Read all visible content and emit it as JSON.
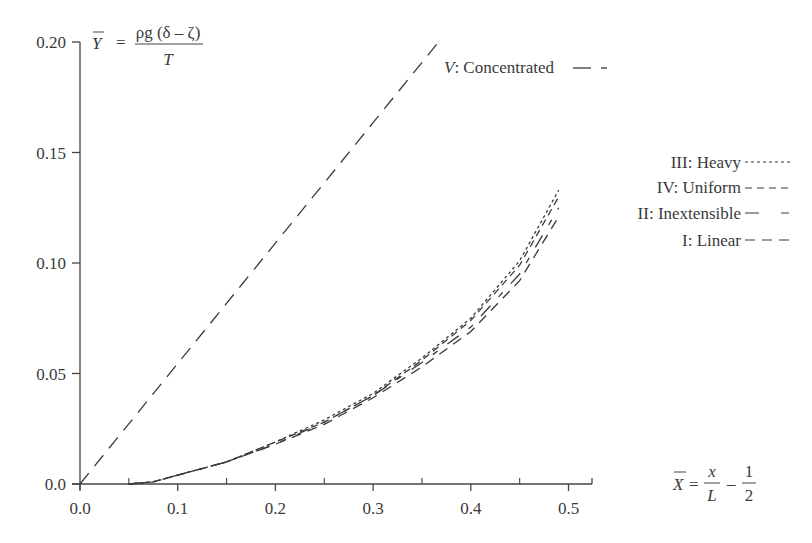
{
  "chart_data": {
    "type": "line",
    "title": "",
    "xlabel": "X̄ = x/L − 1/2",
    "ylabel": "Ȳ = ρg(δ − ζ)/T",
    "xlim": [
      0.0,
      0.524
    ],
    "ylim": [
      0.0,
      0.2
    ],
    "grid": false,
    "legend_position": "right",
    "x_ticks": [
      "0.0",
      "0.1",
      "0.2",
      "0.3",
      "0.4",
      "0.5"
    ],
    "x_minor_ticks": [
      0.05,
      0.15,
      0.25,
      0.35,
      0.45
    ],
    "y_ticks": [
      "0.0",
      "0.05",
      "0.10",
      "0.15",
      "0.20"
    ],
    "series": [
      {
        "name": "V: Concentrated",
        "dash": "long-dash-short-dash",
        "x": [
          0.0,
          0.1,
          0.2,
          0.3,
          0.367
        ],
        "y": [
          0.0,
          0.0545,
          0.109,
          0.1635,
          0.2
        ]
      },
      {
        "name": "III: Heavy",
        "dash": "dotted",
        "x": [
          0.05,
          0.075,
          0.1,
          0.15,
          0.2,
          0.25,
          0.3,
          0.35,
          0.4,
          0.45,
          0.49
        ],
        "y": [
          0.0,
          0.001,
          0.004,
          0.01,
          0.019,
          0.029,
          0.041,
          0.057,
          0.075,
          0.101,
          0.133
        ]
      },
      {
        "name": "IV: Uniform",
        "dash": "short-dash",
        "x": [
          0.05,
          0.075,
          0.1,
          0.15,
          0.2,
          0.25,
          0.3,
          0.35,
          0.4,
          0.45,
          0.49
        ],
        "y": [
          0.0,
          0.001,
          0.004,
          0.01,
          0.019,
          0.028,
          0.04,
          0.056,
          0.074,
          0.099,
          0.13
        ]
      },
      {
        "name": "II: Inextensible",
        "dash": "long-dash-gap",
        "x": [
          0.05,
          0.075,
          0.1,
          0.15,
          0.2,
          0.25,
          0.3,
          0.35,
          0.4,
          0.45,
          0.49
        ],
        "y": [
          0.0,
          0.001,
          0.004,
          0.01,
          0.018,
          0.028,
          0.04,
          0.055,
          0.071,
          0.095,
          0.125
        ]
      },
      {
        "name": "I: Linear",
        "dash": "medium-dash",
        "x": [
          0.05,
          0.075,
          0.1,
          0.15,
          0.2,
          0.25,
          0.3,
          0.35,
          0.4,
          0.45,
          0.49
        ],
        "y": [
          0.0,
          0.001,
          0.004,
          0.01,
          0.018,
          0.027,
          0.039,
          0.053,
          0.069,
          0.092,
          0.121
        ]
      }
    ],
    "annotations": [
      "V: Concentrated — -"
    ]
  },
  "labels": {
    "y_axis": {
      "lhs": "Y",
      "eq": "=",
      "numerator": "ρg (δ – ζ)",
      "denominator": "T"
    },
    "x_axis": {
      "lhs": "X",
      "eq": "=",
      "frac1_num": "x",
      "frac1_den": "L",
      "minus": "–",
      "frac2_num": "1",
      "frac2_den": "2"
    },
    "concentrated_label_v": "V",
    "concentrated_label_rest": ": Concentrated",
    "legend": [
      {
        "label": "III: Heavy"
      },
      {
        "label": "IV: Uniform"
      },
      {
        "label": "II: Inextensible"
      },
      {
        "label": "I: Linear"
      }
    ]
  },
  "colors": {
    "axis": "#444444",
    "line": "#3a3a3a",
    "background": "#ffffff"
  }
}
